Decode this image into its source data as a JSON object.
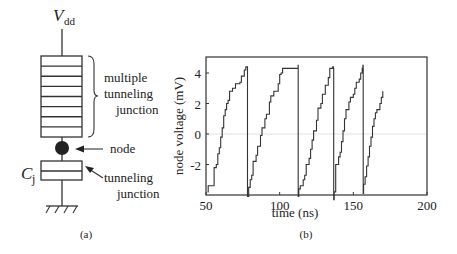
{
  "panel_a": {
    "vdd_label": "V",
    "vdd_sub": "dd",
    "mtj_label": [
      "multiple",
      "tunneling",
      "junction"
    ],
    "node_label": "node",
    "cj_label": "C",
    "cj_sub": "j",
    "tj_label": [
      "tunneling",
      "junction"
    ],
    "caption": "(a)",
    "mtj_segments": 8
  },
  "panel_b": {
    "caption": "(b)",
    "xlabel": "time (ns)",
    "ylabel": "node voltage (mV)",
    "xticks": [
      "50",
      "100",
      "150",
      "200"
    ],
    "yticks": [
      "4",
      "2",
      "0",
      "-2"
    ]
  },
  "chart_data": {
    "type": "line",
    "title": "",
    "xlabel": "time (ns)",
    "ylabel": "node voltage (mV)",
    "xlim": [
      50,
      200
    ],
    "ylim": [
      -4.2,
      5.2
    ],
    "xticks": [
      50,
      100,
      150,
      200
    ],
    "yticks": [
      4,
      2,
      0,
      -2
    ],
    "zero_line": true,
    "series": [
      {
        "name": "node voltage (staircase sawtooth)",
        "points": [
          [
            51,
            -3.8
          ],
          [
            51.5,
            -3.4
          ],
          [
            55,
            -3.4
          ],
          [
            55.5,
            -2.2
          ],
          [
            57,
            -2.0
          ],
          [
            58,
            -1.3
          ],
          [
            59,
            -0.9
          ],
          [
            60,
            -0.2
          ],
          [
            61,
            0.4
          ],
          [
            62,
            1.2
          ],
          [
            63,
            1.6
          ],
          [
            64,
            2.0
          ],
          [
            65,
            2.2
          ],
          [
            66,
            2.8
          ],
          [
            68,
            3.0
          ],
          [
            70,
            3.3
          ],
          [
            73,
            3.4
          ],
          [
            74,
            3.8
          ],
          [
            76,
            4.2
          ],
          [
            77,
            4.4
          ],
          [
            78,
            4.4
          ],
          [
            78.2,
            -4.1
          ],
          [
            79,
            -3.5
          ],
          [
            80,
            -3.0
          ],
          [
            81,
            -2.7
          ],
          [
            82,
            -1.8
          ],
          [
            84,
            -1.4
          ],
          [
            85,
            -0.8
          ],
          [
            87,
            -0.1
          ],
          [
            88,
            0.4
          ],
          [
            90,
            1.0
          ],
          [
            91,
            1.3
          ],
          [
            93,
            2.1
          ],
          [
            94,
            2.5
          ],
          [
            96,
            2.8
          ],
          [
            98,
            2.8
          ],
          [
            99,
            3.3
          ],
          [
            100,
            3.9
          ],
          [
            101,
            4.0
          ],
          [
            102,
            4.3
          ],
          [
            112,
            4.3
          ],
          [
            112.5,
            4.5
          ],
          [
            112.6,
            -4.1
          ],
          [
            113,
            -3.6
          ],
          [
            114,
            -3.4
          ],
          [
            116,
            -3.0
          ],
          [
            117,
            -2.7
          ],
          [
            118,
            -2.0
          ],
          [
            120,
            -1.6
          ],
          [
            121,
            -1.0
          ],
          [
            122,
            -0.4
          ],
          [
            123,
            0.2
          ],
          [
            125,
            0.9
          ],
          [
            126,
            1.7
          ],
          [
            128,
            2.0
          ],
          [
            129,
            2.6
          ],
          [
            131,
            3.2
          ],
          [
            133,
            3.7
          ],
          [
            134,
            4.3
          ],
          [
            136,
            4.4
          ],
          [
            136.5,
            4.3
          ],
          [
            136.7,
            -4.3
          ],
          [
            137,
            -3.8
          ],
          [
            138,
            -2.0
          ],
          [
            140,
            -1.5
          ],
          [
            141,
            -1.2
          ],
          [
            142,
            -0.5
          ],
          [
            143,
            0.2
          ],
          [
            144,
            1.0
          ],
          [
            145,
            1.6
          ],
          [
            147,
            2.1
          ],
          [
            148,
            2.4
          ],
          [
            150,
            2.6
          ],
          [
            151,
            3.0
          ],
          [
            152,
            3.4
          ],
          [
            154,
            3.6
          ],
          [
            155,
            4.0
          ],
          [
            156,
            4.3
          ],
          [
            156.5,
            4.5
          ],
          [
            156.7,
            -3.9
          ],
          [
            157,
            -3.3
          ],
          [
            158,
            -2.8
          ],
          [
            159,
            -2.1
          ],
          [
            160,
            -1.5
          ],
          [
            161,
            -0.8
          ],
          [
            162,
            -0.2
          ],
          [
            163,
            0.5
          ],
          [
            164,
            1.0
          ],
          [
            165,
            1.4
          ],
          [
            166,
            1.6
          ],
          [
            168,
            2.0
          ],
          [
            169,
            2.4
          ],
          [
            170,
            2.8
          ]
        ]
      }
    ]
  }
}
